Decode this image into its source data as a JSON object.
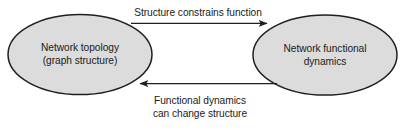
{
  "diagram": {
    "type": "cycle-two-node",
    "background_color": "#ffffff",
    "node_fill_color": "#dcdcdc",
    "node_stroke_color": "#1f1f1f",
    "edge_color": "#1f1f1f",
    "text_color": "#1b1b1b",
    "nodes": [
      {
        "id": "network-topology",
        "shape": "ellipse",
        "line1": "Network topology",
        "line2": "(graph structure)",
        "cx": 80,
        "cy": 54.5,
        "rx": 72,
        "ry": 40
      },
      {
        "id": "network-functional-dynamics",
        "shape": "ellipse",
        "line1": "Network functional",
        "line2": "dynamics",
        "cx": 325,
        "cy": 55,
        "rx": 72,
        "ry": 40
      }
    ],
    "edges": [
      {
        "id": "structure-constrains-function",
        "direction": "left-to-right",
        "label_line1": "Structure constrains function",
        "label_line2": "",
        "label_position": "above"
      },
      {
        "id": "dynamics-change-structure",
        "direction": "right-to-left",
        "label_line1": "Functional dynamics",
        "label_line2": "can change structure",
        "label_position": "below"
      }
    ]
  }
}
